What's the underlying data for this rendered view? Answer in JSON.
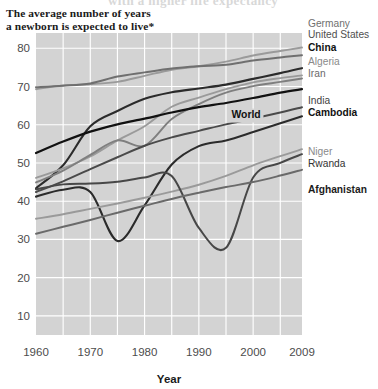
{
  "header": {
    "cropped_title_remnant": "with a higher life expectancy",
    "title_line_1": "The average number of years",
    "title_line_2": "a newborn is expected to live*"
  },
  "axes": {
    "y_ticks": [
      "80",
      "70",
      "60",
      "50",
      "40",
      "30",
      "20",
      "10"
    ],
    "x_ticks": [
      "1960",
      "1970",
      "1980",
      "1990",
      "2000",
      "2009"
    ],
    "x_axis_title": "Year",
    "y_axis_title": ""
  },
  "colors": {
    "plot_background": "#d3d3d3",
    "gridline": "#ffffff",
    "page_background": "#ffffff",
    "dark": "#2b2b2b",
    "black": "#111111",
    "mid": "#636363",
    "light": "#9a9a9a",
    "lighter": "#ababab"
  },
  "chart_data": {
    "type": "line",
    "title": "The average number of years a newborn is expected to live*",
    "xlabel": "Year",
    "ylabel": "",
    "xlim": [
      1960,
      2009
    ],
    "ylim": [
      5,
      84
    ],
    "ytick_values": [
      80,
      70,
      60,
      50,
      40,
      30,
      20,
      10
    ],
    "xtick_values": [
      1960,
      1970,
      1980,
      1990,
      2000,
      2009
    ],
    "grid": true,
    "legend_position": "right-inline",
    "x": [
      1960,
      1965,
      1970,
      1975,
      1980,
      1985,
      1990,
      1995,
      2000,
      2005,
      2009
    ],
    "series": [
      {
        "name": "Germany",
        "label": "Germany",
        "color": "#9a9a9a",
        "weight": 1.9,
        "label_weight": "normal",
        "label_color": "#6f6f6f",
        "label_y": 24,
        "values": [
          69.3,
          70.3,
          70.6,
          71.2,
          72.8,
          74.4,
          75.3,
          76.5,
          78.1,
          79.3,
          80.2
        ]
      },
      {
        "name": "United States",
        "label": "United States",
        "color": "#6f6f6f",
        "weight": 2.0,
        "label_weight": "normal",
        "label_color": "#4f4f4f",
        "label_y": 35,
        "values": [
          69.8,
          70.2,
          70.8,
          72.6,
          73.7,
          74.7,
          75.3,
          75.7,
          76.8,
          77.6,
          78.2
        ]
      },
      {
        "name": "China",
        "label": "China",
        "color": "#2b2b2b",
        "weight": 2.1,
        "label_weight": "bold",
        "label_color": "#111111",
        "label_y": 48,
        "values": [
          43.4,
          49.4,
          59.6,
          63.6,
          66.8,
          68.5,
          69.5,
          70.5,
          72.0,
          73.5,
          74.8
        ]
      },
      {
        "name": "Algeria",
        "label": "Algeria",
        "color": "#9a9a9a",
        "weight": 1.9,
        "label_weight": "normal",
        "label_color": "#8a8a8a",
        "label_y": 62,
        "values": [
          46.1,
          48.6,
          51.7,
          55.9,
          59.6,
          64.7,
          67.1,
          69.3,
          71.1,
          72.2,
          72.9
        ]
      },
      {
        "name": "Iran",
        "label": "Iran",
        "color": "#7f7f7f",
        "weight": 1.9,
        "label_weight": "normal",
        "label_color": "#6a6a6a",
        "label_y": 74,
        "values": [
          44.9,
          48.0,
          52.1,
          55.9,
          54.5,
          61.5,
          65.4,
          68.4,
          70.1,
          71.2,
          72.1
        ]
      },
      {
        "name": "World",
        "label": "World",
        "color": "#111111",
        "weight": 2.2,
        "label_weight": "bold",
        "label_color": "#111111",
        "label_inline": true,
        "label_x": 1996,
        "label_y": 62.4,
        "values": [
          52.6,
          55.6,
          58.2,
          60.1,
          61.6,
          63.2,
          64.6,
          65.7,
          67.0,
          68.4,
          69.3
        ]
      },
      {
        "name": "India",
        "label": "India",
        "color": "#4a4a4a",
        "weight": 2.0,
        "label_weight": "normal",
        "label_color": "#3f3f3f",
        "label_y": 101,
        "values": [
          42.4,
          45.2,
          48.4,
          51.5,
          54.5,
          56.7,
          58.4,
          60.1,
          61.6,
          63.2,
          64.6
        ]
      },
      {
        "name": "Cambodia",
        "label": "Cambodia",
        "color": "#2b2b2b",
        "weight": 2.1,
        "label_weight": "bold",
        "label_color": "#111111",
        "label_y": 113,
        "values": [
          41.2,
          43.0,
          42.4,
          29.6,
          38.9,
          49.6,
          54.4,
          55.9,
          58.1,
          60.4,
          62.2
        ]
      },
      {
        "name": "Niger",
        "label": "Niger",
        "color": "#9a9a9a",
        "weight": 1.9,
        "label_weight": "normal",
        "label_color": "#8a8a8a",
        "label_y": 152,
        "values": [
          35.4,
          36.6,
          38.0,
          39.4,
          40.9,
          42.5,
          44.3,
          46.6,
          49.4,
          51.8,
          53.6
        ]
      },
      {
        "name": "Rwanda",
        "label": "Rwanda",
        "color": "#474747",
        "weight": 2.0,
        "label_weight": "normal",
        "label_color": "#333333",
        "label_y": 164,
        "values": [
          43.1,
          44.4,
          44.6,
          45.1,
          46.2,
          46.6,
          33.0,
          27.8,
          46.2,
          50.0,
          52.3
        ]
      },
      {
        "name": "Afghanistan",
        "label": "Afghanistan",
        "color": "#6a6a6a",
        "weight": 2.0,
        "label_weight": "bold",
        "label_color": "#1b1b1b",
        "label_y": 190,
        "values": [
          31.5,
          33.3,
          35.1,
          37.0,
          38.8,
          40.6,
          42.2,
          43.7,
          45.0,
          46.7,
          48.2
        ]
      }
    ]
  }
}
